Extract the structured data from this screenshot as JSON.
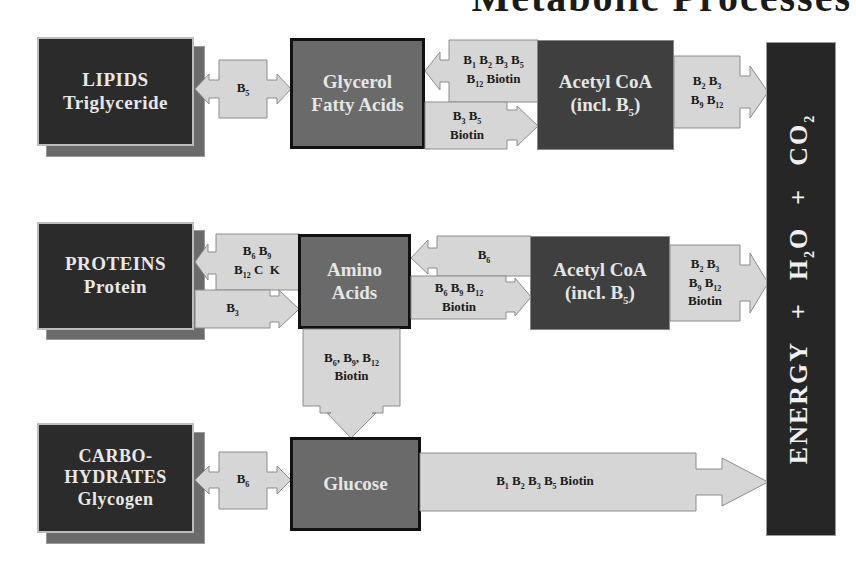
{
  "title": {
    "text": "Metabolic Processes",
    "note": "top edge cropped; only lower portion of title glyphs visible"
  },
  "colors": {
    "source_box": "#2b2b2b",
    "intermediate_box": "#6a6a6a",
    "acetyl_box": "#3f3f3f",
    "arrow_fill": "#d6d6d6",
    "energy_bar": "#262626",
    "text_light": "#e8e8e8",
    "text_dark": "#1b1b1b"
  },
  "rows": {
    "lipids": {
      "source": {
        "line1": "LIPIDS",
        "line2": "Triglyceride"
      },
      "to_intermediate_vitamins": "B5",
      "intermediate": {
        "line1": "Glycerol",
        "line2": "Fatty Acids"
      },
      "back_arrow_vitamins": {
        "line1": "B1 B2 B3 B5",
        "line2": "B12 Biotin"
      },
      "forward_arrow_vitamins": {
        "line1": "B3 B5",
        "line2": "Biotin"
      },
      "acetyl": {
        "line1": "Acetyl CoA",
        "line2": "(incl. B5)"
      },
      "to_energy_vitamins": {
        "line1": "B2 B3",
        "line2": "B9 B12"
      }
    },
    "proteins": {
      "source": {
        "line1": "PROTEINS",
        "line2": "Protein"
      },
      "back_arrow_vitamins": {
        "line1": "B6 B9",
        "line2": "B12 C K"
      },
      "forward_arrow_vitamins": "B3",
      "intermediate": {
        "line1": "Amino",
        "line2": "Acids"
      },
      "from_acetyl_vitamins": "B6",
      "to_acetyl_vitamins": {
        "line1": "B6 B9 B12",
        "line2": "Biotin"
      },
      "acetyl": {
        "line1": "Acetyl CoA",
        "line2": "(incl. B5)"
      },
      "to_energy_vitamins": {
        "line1": "B2 B3",
        "line2": "B9 B12",
        "line3": "Biotin"
      },
      "down_arrow_vitamins": {
        "line1": "B6 B9 B12",
        "line2": "Biotin"
      }
    },
    "carbohydrates": {
      "source": {
        "line1": "CARBO-",
        "line2": "HYDRATES",
        "line3": "Glycogen"
      },
      "to_intermediate_vitamins": "B6",
      "intermediate": "Glucose",
      "to_energy_vitamins": "B1 B2 B3 B5 Biotin"
    }
  },
  "energy_bar": {
    "energy": "ENERGY",
    "plus1": "+",
    "water": "H2O",
    "plus2": "+",
    "co2": "CO2"
  }
}
